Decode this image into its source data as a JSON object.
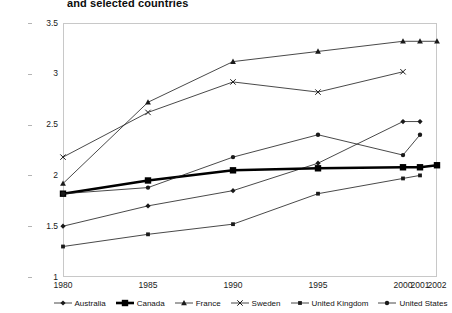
{
  "title": "and selected countries",
  "chart_data": {
    "type": "line",
    "title": "and selected countries",
    "subtitle": "",
    "xlabel": "",
    "ylabel": "",
    "x": [
      1980,
      1985,
      1990,
      1995,
      2000,
      2001,
      2002
    ],
    "xtick_labels": [
      "1980",
      "1985",
      "1990",
      "1995",
      "2000",
      "2001",
      "2002"
    ],
    "ytick_labels": [
      "1",
      "1.5",
      "2",
      "2.5",
      "3",
      "3.5"
    ],
    "ytick_values": [
      1,
      1.5,
      2,
      2.5,
      3,
      3.5
    ],
    "ylim": [
      1,
      3.5
    ],
    "xlim": [
      1980,
      2002
    ],
    "grid": false,
    "legend_position": "bottom",
    "series": [
      {
        "name": "Australia",
        "marker": "diamond",
        "color": "#1a1a1a",
        "width": 0.8,
        "points": [
          {
            "x": 1980,
            "y": 1.5
          },
          {
            "x": 1985,
            "y": 1.7
          },
          {
            "x": 1990,
            "y": 1.85
          },
          {
            "x": 1995,
            "y": 2.12
          },
          {
            "x": 2000,
            "y": 2.53
          },
          {
            "x": 2001,
            "y": 2.53
          }
        ]
      },
      {
        "name": "Canada",
        "marker": "square-bold",
        "color": "#000000",
        "width": 2.6,
        "points": [
          {
            "x": 1980,
            "y": 1.82
          },
          {
            "x": 1985,
            "y": 1.95
          },
          {
            "x": 1990,
            "y": 2.05
          },
          {
            "x": 1995,
            "y": 2.07
          },
          {
            "x": 2000,
            "y": 2.08
          },
          {
            "x": 2001,
            "y": 2.08
          },
          {
            "x": 2002,
            "y": 2.1
          }
        ]
      },
      {
        "name": "France",
        "marker": "triangle",
        "color": "#1a1a1a",
        "width": 0.8,
        "points": [
          {
            "x": 1980,
            "y": 1.92
          },
          {
            "x": 1985,
            "y": 2.72
          },
          {
            "x": 1990,
            "y": 3.12
          },
          {
            "x": 1995,
            "y": 3.22
          },
          {
            "x": 2000,
            "y": 3.32
          },
          {
            "x": 2001,
            "y": 3.32
          },
          {
            "x": 2002,
            "y": 3.32
          }
        ]
      },
      {
        "name": "Sweden",
        "marker": "x",
        "color": "#1a1a1a",
        "width": 0.8,
        "points": [
          {
            "x": 1980,
            "y": 2.18
          },
          {
            "x": 1985,
            "y": 2.62
          },
          {
            "x": 1990,
            "y": 2.92
          },
          {
            "x": 1995,
            "y": 2.82
          },
          {
            "x": 2000,
            "y": 3.02
          }
        ]
      },
      {
        "name": "United Kingdom",
        "marker": "square-small",
        "color": "#1a1a1a",
        "width": 0.8,
        "points": [
          {
            "x": 1980,
            "y": 1.3
          },
          {
            "x": 1985,
            "y": 1.42
          },
          {
            "x": 1990,
            "y": 1.52
          },
          {
            "x": 1995,
            "y": 1.82
          },
          {
            "x": 2000,
            "y": 1.97
          },
          {
            "x": 2001,
            "y": 2.0
          }
        ]
      },
      {
        "name": "United States",
        "marker": "circle",
        "color": "#1a1a1a",
        "width": 0.8,
        "points": [
          {
            "x": 1980,
            "y": 1.82
          },
          {
            "x": 1985,
            "y": 1.88
          },
          {
            "x": 1990,
            "y": 2.18
          },
          {
            "x": 1995,
            "y": 2.4
          },
          {
            "x": 2000,
            "y": 2.2
          },
          {
            "x": 2001,
            "y": 2.4
          }
        ]
      }
    ]
  },
  "legend": {
    "items": [
      {
        "label": "Australia"
      },
      {
        "label": "Canada"
      },
      {
        "label": "France"
      },
      {
        "label": "Sweden"
      },
      {
        "label": "United Kingdom"
      },
      {
        "label": "United States"
      }
    ]
  }
}
